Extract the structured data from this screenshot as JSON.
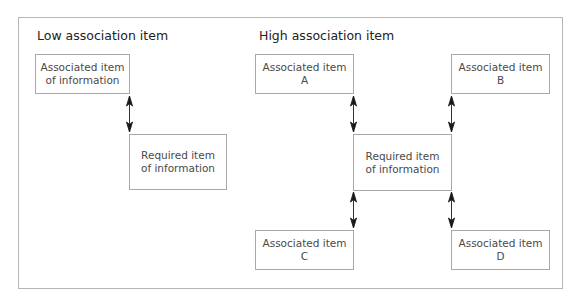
{
  "diagram": {
    "low": {
      "heading": "Low association item",
      "associated": {
        "line1": "Associated item",
        "line2": "of information"
      },
      "required": {
        "line1": "Required item",
        "line2": "of information"
      }
    },
    "high": {
      "heading": "High association item",
      "required": {
        "line1": "Required item",
        "line2": "of information"
      },
      "items": [
        {
          "line1": "Associated item",
          "line2": "A"
        },
        {
          "line1": "Associated item",
          "line2": "B"
        },
        {
          "line1": "Associated item",
          "line2": "C"
        },
        {
          "line1": "Associated item",
          "line2": "D"
        }
      ]
    },
    "colors": {
      "border": "#a9a9a9",
      "frame": "#b5b5b5",
      "arrow": "#1a1a1a",
      "text": "#4a4a4a"
    }
  }
}
